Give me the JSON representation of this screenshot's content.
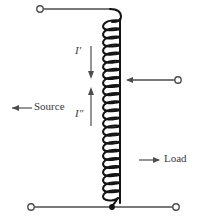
{
  "figure": {
    "kind": "autotransformer-schematic",
    "width": 200,
    "height": 220,
    "background_color": "#ffffff",
    "ink_color": "#1a1a1a",
    "wire_color": "#4d4d4d",
    "text_color": "#3a3a3a"
  },
  "labels": {
    "source": "Source",
    "load": "Load",
    "current_upper": "I′",
    "current_lower": "I″"
  },
  "terminals": [
    {
      "name": "top-left-terminal",
      "cx": 40,
      "cy": 9,
      "r": 3.2
    },
    {
      "name": "right-middle-terminal",
      "cx": 178,
      "cy": 80,
      "r": 3.2
    },
    {
      "name": "bottom-left-terminal",
      "cx": 31,
      "cy": 207,
      "r": 3.2
    },
    {
      "name": "bottom-right-terminal",
      "cx": 176,
      "cy": 207,
      "r": 3.2
    }
  ],
  "junction_dot": {
    "name": "bottom-junction-dot",
    "cx": 112,
    "cy": 207,
    "r": 2.8
  },
  "coil": {
    "turns_total": 23,
    "turns_upper_section": 11,
    "turns_lower_section": 12,
    "axis_x": 119,
    "loop_left_x": 102,
    "top_y": 17,
    "bottom_y": 204,
    "tap_y": 80
  },
  "arrows": {
    "source_arrow": {
      "name": "source-arrow",
      "x1": 32,
      "y1": 108,
      "x2": 8,
      "y2": 108,
      "direction": "left"
    },
    "load_arrow": {
      "name": "load-arrow",
      "x1": 138,
      "y1": 160,
      "x2": 160,
      "y2": 160,
      "direction": "right"
    },
    "tap_arrow": {
      "name": "tap-feed-arrow",
      "x1": 174,
      "y1": 80,
      "x2": 125,
      "y2": 80,
      "direction": "left"
    },
    "current_upper_arrow": {
      "name": "current-upper-arrow",
      "x1": 91,
      "y1": 45,
      "x2": 91,
      "y2": 78,
      "direction": "down"
    },
    "current_lower_arrow": {
      "name": "current-lower-arrow",
      "x1": 91,
      "y1": 126,
      "x2": 91,
      "y2": 88,
      "direction": "up"
    }
  }
}
